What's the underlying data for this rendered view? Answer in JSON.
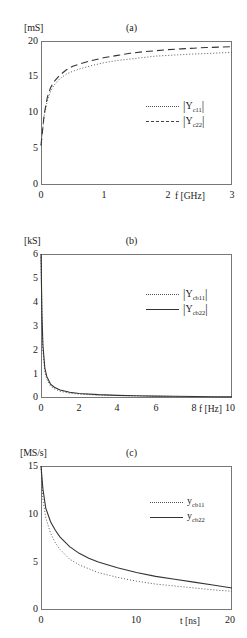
{
  "figure": {
    "panels": [
      {
        "caption": "(a)",
        "y_unit": "[mS]",
        "x_name": "f [GHz]",
        "yticks": [
          "0",
          "5",
          "10",
          "15",
          "20"
        ],
        "xticks": [
          "0",
          "1",
          "2",
          "3"
        ],
        "legend": [
          {
            "style": "dotted",
            "text": "|Y",
            "sub": "c11",
            "tail": "|"
          },
          {
            "style": "dashed",
            "text": "|Y",
            "sub": "c22",
            "tail": "|"
          }
        ]
      },
      {
        "caption": "(b)",
        "y_unit": "[kS]",
        "x_name": "f [Hz]",
        "yticks": [
          "0",
          "1",
          "2",
          "3",
          "4",
          "5",
          "6"
        ],
        "xticks": [
          "0",
          "2",
          "4",
          "6",
          "8",
          "10"
        ],
        "legend": [
          {
            "style": "dotted",
            "text": "|Y",
            "sub": "cb11",
            "tail": "|"
          },
          {
            "style": "solid",
            "text": "|Y",
            "sub": "cb22",
            "tail": "|"
          }
        ]
      },
      {
        "caption": "(c)",
        "y_unit": "[MS/s]",
        "x_name": "t [ns]",
        "yticks": [
          "0",
          "5",
          "10",
          "15"
        ],
        "xticks": [
          "0",
          "10",
          "20"
        ],
        "legend": [
          {
            "style": "dotted",
            "text": "y",
            "sub": "cb11",
            "tail": ""
          },
          {
            "style": "solid",
            "text": "y",
            "sub": "cb22",
            "tail": ""
          }
        ]
      }
    ]
  },
  "chart_data": [
    {
      "type": "line",
      "title": "(a)",
      "xlabel": "f [GHz]",
      "ylabel": "[mS]",
      "xlim": [
        0,
        3
      ],
      "ylim": [
        0,
        20
      ],
      "xticks": [
        0,
        1,
        2,
        3
      ],
      "yticks": [
        0,
        5,
        10,
        15,
        20
      ],
      "grid": false,
      "legend_position": "center-right",
      "series": [
        {
          "name": "|Yc11|",
          "style": "dotted",
          "x": [
            0,
            0.05,
            0.1,
            0.15,
            0.2,
            0.3,
            0.4,
            0.5,
            0.6,
            0.8,
            1.0,
            1.2,
            1.4,
            1.6,
            1.8,
            2.0,
            2.2,
            2.4,
            2.6,
            2.8,
            3.0
          ],
          "y": [
            5.5,
            9.6,
            11.8,
            13.0,
            13.8,
            14.8,
            15.4,
            15.8,
            16.1,
            16.6,
            17.0,
            17.3,
            17.5,
            17.7,
            17.9,
            18.0,
            18.1,
            18.2,
            18.25,
            18.35,
            18.4
          ]
        },
        {
          "name": "|Yc22|",
          "style": "dashed",
          "x": [
            0,
            0.05,
            0.1,
            0.15,
            0.2,
            0.3,
            0.4,
            0.5,
            0.6,
            0.8,
            1.0,
            1.2,
            1.4,
            1.6,
            1.8,
            2.0,
            2.2,
            2.4,
            2.6,
            2.8,
            3.0
          ],
          "y": [
            5.5,
            9.8,
            12.2,
            13.5,
            14.3,
            15.3,
            16.0,
            16.5,
            16.8,
            17.3,
            17.7,
            18.0,
            18.3,
            18.5,
            18.65,
            18.8,
            18.9,
            19.0,
            19.1,
            19.15,
            19.2
          ]
        }
      ]
    },
    {
      "type": "line",
      "title": "(b)",
      "xlabel": "f [Hz]",
      "ylabel": "[kS]",
      "xlim": [
        0,
        10
      ],
      "ylim": [
        0,
        6
      ],
      "xticks": [
        0,
        2,
        4,
        6,
        8,
        10
      ],
      "yticks": [
        0,
        1,
        2,
        3,
        4,
        5,
        6
      ],
      "grid": false,
      "legend_position": "center-right",
      "series": [
        {
          "name": "|Ycb11|",
          "style": "dotted",
          "x": [
            0,
            0.05,
            0.1,
            0.2,
            0.3,
            0.5,
            0.7,
            1.0,
            1.5,
            2.0,
            3.0,
            4.0,
            5.0,
            6.0,
            7.0,
            8.0,
            9.0,
            10.0
          ],
          "y": [
            6.0,
            3.3,
            2.0,
            1.1,
            0.78,
            0.5,
            0.38,
            0.28,
            0.2,
            0.16,
            0.12,
            0.1,
            0.08,
            0.07,
            0.06,
            0.05,
            0.045,
            0.04
          ]
        },
        {
          "name": "|Ycb22|",
          "style": "solid",
          "x": [
            0,
            0.05,
            0.1,
            0.2,
            0.3,
            0.5,
            0.7,
            1.0,
            1.5,
            2.0,
            3.0,
            4.0,
            5.0,
            6.0,
            7.0,
            8.0,
            9.0,
            10.0
          ],
          "y": [
            6.0,
            3.5,
            2.2,
            1.25,
            0.9,
            0.58,
            0.45,
            0.33,
            0.24,
            0.19,
            0.14,
            0.11,
            0.095,
            0.08,
            0.07,
            0.06,
            0.055,
            0.05
          ]
        }
      ]
    },
    {
      "type": "line",
      "title": "(c)",
      "xlabel": "t [ns]",
      "ylabel": "[MS/s]",
      "xlim": [
        0,
        20
      ],
      "ylim": [
        0,
        15
      ],
      "xticks": [
        0,
        10,
        20
      ],
      "yticks": [
        0,
        5,
        10,
        15
      ],
      "grid": false,
      "legend_position": "center-right",
      "series": [
        {
          "name": "ycb11",
          "style": "dotted",
          "x": [
            0,
            0.2,
            0.5,
            1.0,
            1.5,
            2.0,
            3.0,
            4.0,
            5.0,
            6.0,
            8.0,
            10.0,
            12.0,
            14.0,
            16.0,
            18.0,
            20.0
          ],
          "y": [
            15.0,
            11.5,
            9.6,
            8.0,
            7.0,
            6.3,
            5.3,
            4.7,
            4.3,
            3.9,
            3.4,
            3.0,
            2.7,
            2.5,
            2.3,
            2.1,
            1.95
          ]
        },
        {
          "name": "ycb22",
          "style": "solid",
          "x": [
            0,
            0.2,
            0.5,
            1.0,
            1.5,
            2.0,
            3.0,
            4.0,
            5.0,
            6.0,
            8.0,
            10.0,
            12.0,
            14.0,
            16.0,
            18.0,
            20.0
          ],
          "y": [
            15.0,
            12.6,
            10.6,
            9.2,
            8.3,
            7.6,
            6.6,
            5.9,
            5.4,
            5.0,
            4.4,
            3.9,
            3.5,
            3.2,
            2.9,
            2.6,
            2.3
          ]
        }
      ]
    }
  ]
}
